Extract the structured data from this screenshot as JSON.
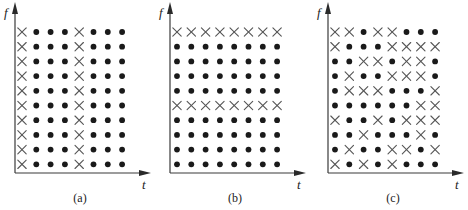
{
  "figure": {
    "legend": {
      "cross": "x-mark",
      "dot": "filled-dot"
    },
    "panels": [
      {
        "caption": "(a)",
        "y_axis_label": "f",
        "x_axis_label": "t",
        "grid": [
          "XOOOXOOO",
          "XOOOXOOO",
          "XOOOXOOO",
          "XOOOXOOO",
          "XOOOXOOO",
          "XOOOXOOO",
          "XOOOXOOO",
          "XOOOXOOO",
          "XOOOXOOO",
          "XOOOXOOO"
        ]
      },
      {
        "caption": "(b)",
        "y_axis_label": "f",
        "x_axis_label": "t",
        "grid": [
          "XXXXXXXX",
          "OOOOOOOO",
          "OOOOOOOO",
          "OOOOOOOO",
          "OOOOOOOO",
          "XXXXXXXX",
          "OOOOOOOO",
          "OOOOOOOO",
          "OOOOOOOO",
          "OOOOOOOO"
        ]
      },
      {
        "caption": "(c)",
        "y_axis_label": "f",
        "x_axis_label": "t",
        "grid": [
          "XXOXXOOO",
          "XOOOXXXX",
          "OOXXOXXO",
          "OXOOXXXO",
          "OXXXOOOX",
          "OOOOOOXX",
          "XOOXOXXX",
          "OOXOOOXO",
          "OXOOXXOX",
          "XOXOXOOO"
        ]
      }
    ]
  }
}
